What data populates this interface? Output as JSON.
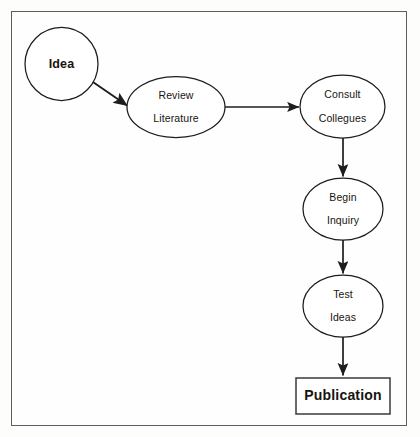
{
  "diagram": {
    "background_color": "#fdfdfc",
    "frame_color": "#5d5d5d",
    "stroke_color": "#1d1d1d",
    "text_color": "#17140f",
    "nodes": [
      {
        "id": "idea",
        "label": "Idea",
        "shape": "circle",
        "cx": 61.5,
        "cy": 64,
        "rx": 36.5,
        "ry": 36.5,
        "bold": true
      },
      {
        "id": "review-literature",
        "label": "Review\nLiterature",
        "line1": "Review",
        "line2": "Literature",
        "shape": "ellipse",
        "cx": 176,
        "cy": 107,
        "rx": 49,
        "ry": 30.5,
        "bold": false
      },
      {
        "id": "consult-collegues",
        "label": "Consult\nCollegues",
        "line1": "Consult",
        "line2": "Collegues",
        "shape": "ellipse",
        "cx": 342.5,
        "cy": 106.5,
        "rx": 42.5,
        "ry": 31.5,
        "bold": false
      },
      {
        "id": "begin-inquiry",
        "label": "Begin\nInquiry",
        "line1": "Begin",
        "line2": "Inquiry",
        "shape": "ellipse",
        "cx": 343,
        "cy": 209,
        "rx": 40,
        "ry": 31,
        "bold": false
      },
      {
        "id": "test-ideas",
        "label": "Test\nIdeas",
        "line1": "Test",
        "line2": "Ideas",
        "shape": "ellipse",
        "cx": 343,
        "cy": 306,
        "rx": 40,
        "ry": 31,
        "bold": false
      },
      {
        "id": "publication",
        "label": "Publication",
        "shape": "rectangle",
        "x": 296,
        "y": 378,
        "width": 94,
        "height": 36,
        "bold": true
      }
    ],
    "edges": [
      {
        "id": "idea-to-review",
        "from": "idea",
        "to": "review-literature",
        "direction": "diagonal-down-right",
        "x1": 90,
        "y1": 80,
        "x2": 129,
        "y2": 107
      },
      {
        "id": "review-to-consult",
        "from": "review-literature",
        "to": "consult-collegues",
        "direction": "right",
        "x1": 225,
        "y1": 107,
        "x2": 300,
        "y2": 107
      },
      {
        "id": "consult-to-begin",
        "from": "consult-collegues",
        "to": "begin-inquiry",
        "direction": "down",
        "x1": 343,
        "y1": 138,
        "x2": 343,
        "y2": 178
      },
      {
        "id": "begin-to-test",
        "from": "begin-inquiry",
        "to": "test-ideas",
        "direction": "down",
        "x1": 343,
        "y1": 240,
        "x2": 343,
        "y2": 275
      },
      {
        "id": "test-to-publication",
        "from": "test-ideas",
        "to": "publication",
        "direction": "down",
        "x1": 343,
        "y1": 337,
        "x2": 343,
        "y2": 377
      }
    ]
  }
}
